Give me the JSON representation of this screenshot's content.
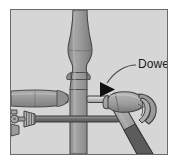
{
  "figure": {
    "domain": "diagram",
    "caption_label": "Dowel",
    "frame": {
      "border_color": "#6a6a6a",
      "background_color": "#d6d6d6",
      "outer_background": "#ffffff"
    },
    "palette": {
      "background": "#d6d6d6",
      "wood_light": "#c2c2c2",
      "wood_mid": "#969696",
      "wood_dark": "#7d7d7d",
      "metal_mid": "#a8a8a8",
      "metal_dark": "#6e6e6e",
      "grip_dark": "#5c5c5c",
      "outline": "#3d3d3d",
      "arrow_black": "#111111",
      "leader_line": "#4a4a4a",
      "text": "#1c1c1c"
    },
    "annotation": {
      "label": "Dowel",
      "label_x": 130,
      "label_y": 70,
      "arrow_tip_x": 96,
      "arrow_tip_y": 96,
      "leader_from_x": 128,
      "leader_from_y": 66,
      "arrow_color": "#111111"
    },
    "objects": [
      {
        "name": "turned-post",
        "description": "vertical turned wooden chair post",
        "color": "#969696"
      },
      {
        "name": "dowel-peg",
        "description": "short horizontal dowel protruding from post",
        "color": "#c2c2c2"
      },
      {
        "name": "horizontal-rail",
        "description": "wooden rail joining post from left",
        "color": "#9e9e9e"
      },
      {
        "name": "bar-clamp",
        "description": "bar clamp with threaded screw handle at lower left",
        "color": "#a8a8a8"
      },
      {
        "name": "claw-hammer",
        "description": "claw hammer striking the dowel from lower right",
        "color": "#a0a0a0"
      }
    ]
  }
}
